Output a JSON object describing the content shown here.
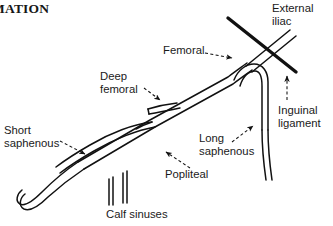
{
  "page": {
    "title_fragment": "MATION",
    "background_color": "#ffffff",
    "ink_color": "#111111",
    "width": 333,
    "height": 226
  },
  "diagram": {
    "caption": "Venous anatomy of the leg showing deep and superficial veins",
    "labels": [
      {
        "id": "external-iliac",
        "text": "External\niliac",
        "line1": "External",
        "line2": "iliac"
      },
      {
        "id": "femoral",
        "text": "Femoral",
        "line1": "Femoral",
        "line2": ""
      },
      {
        "id": "deep-femoral",
        "text": "Deep\nfemoral",
        "line1": "Deep",
        "line2": "femoral"
      },
      {
        "id": "inguinal-ligament",
        "text": "Inguinal\nligament",
        "line1": "Inguinal",
        "line2": "ligament"
      },
      {
        "id": "short-saphenous",
        "text": "Short\nsaphenous",
        "line1": "Short",
        "line2": "saphenous"
      },
      {
        "id": "long-saphenous",
        "text": "Long\nsaphenous",
        "line1": "Long",
        "line2": "saphenous"
      },
      {
        "id": "popliteal",
        "text": "Popliteal",
        "line1": "Popliteal",
        "line2": ""
      },
      {
        "id": "calf-sinuses",
        "text": "Calf sinuses",
        "line1": "Calf sinuses",
        "line2": ""
      }
    ]
  }
}
